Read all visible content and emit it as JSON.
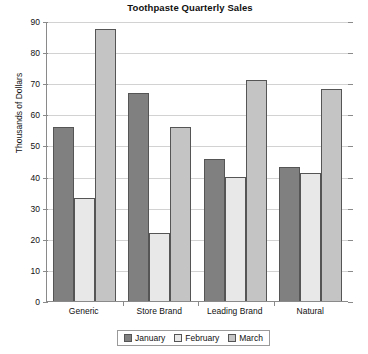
{
  "chart_data": {
    "type": "bar",
    "title": "Toothpaste Quarterly Sales",
    "xlabel": "",
    "ylabel": "Thousands of Dollars",
    "categories": [
      "Generic",
      "Store Brand",
      "Leading Brand",
      "Natural"
    ],
    "series": [
      {
        "name": "January",
        "values": [
          56,
          67,
          45.5,
          43
        ],
        "color": "#808080"
      },
      {
        "name": "February",
        "values": [
          33,
          22,
          40,
          41
        ],
        "color": "#e8e8e8"
      },
      {
        "name": "March",
        "values": [
          87.5,
          56,
          71,
          68
        ],
        "color": "#c4c4c4"
      }
    ],
    "ylim": [
      0,
      90
    ],
    "yticks": [
      0,
      10,
      20,
      30,
      40,
      50,
      60,
      70,
      80,
      90
    ],
    "ytick_labels": [
      "0",
      "10",
      "20",
      "30",
      "40",
      "50",
      "60",
      "70",
      "80",
      "90"
    ],
    "grid": true,
    "legend_position": "bottom-center"
  }
}
